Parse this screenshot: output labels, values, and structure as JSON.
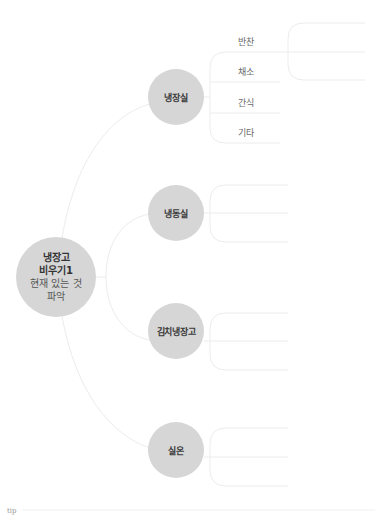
{
  "root": {
    "lines": [
      "냉장고",
      "비우기1",
      "현재 있는 것",
      "파악"
    ]
  },
  "branches": [
    {
      "label": "냉장실",
      "children": [
        {
          "label": "반찬"
        },
        {
          "label": "채소"
        },
        {
          "label": "간식"
        },
        {
          "label": "기타"
        }
      ]
    },
    {
      "label": "냉동실",
      "children": []
    },
    {
      "label": "김치냉장고",
      "children": []
    },
    {
      "label": "실온",
      "children": []
    }
  ],
  "footer": {
    "tip_label": "tip"
  },
  "colors": {
    "node_fill": "#d6d6d6",
    "connector": "#ececec",
    "text_dark": "#3a3a3a",
    "text_leaf": "#6a6a6a"
  }
}
